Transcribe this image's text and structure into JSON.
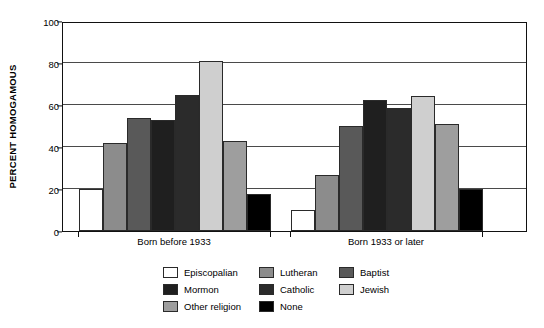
{
  "chart_data": {
    "type": "bar",
    "title": "",
    "subtitle": "",
    "xlabel": "",
    "ylabel": "PERCENT HOMOGAMOUS",
    "ylim": [
      0,
      100
    ],
    "yticks": [
      0,
      20,
      40,
      60,
      80,
      100
    ],
    "ytick_labels": [
      "0",
      "20",
      "40",
      "60",
      "80",
      "100"
    ],
    "grid": true,
    "legend_position": "bottom",
    "categories": [
      "Born before 1933",
      "Born 1933 or later"
    ],
    "series": [
      {
        "name": "Episcopalian",
        "color": "#ffffff",
        "values": [
          20,
          10
        ]
      },
      {
        "name": "Lutheran",
        "color": "#8c8c8c",
        "values": [
          42,
          26.5
        ]
      },
      {
        "name": "Baptist",
        "color": "#595959",
        "values": [
          54,
          50
        ]
      },
      {
        "name": "Mormon",
        "color": "#1f1f1f",
        "values": [
          53,
          62.5
        ]
      },
      {
        "name": "Catholic",
        "color": "#2b2b2b",
        "values": [
          65,
          58.5
        ]
      },
      {
        "name": "Jewish",
        "color": "#cfcfcf",
        "values": [
          81,
          64.5
        ]
      },
      {
        "name": "Other religion",
        "color": "#9e9e9e",
        "values": [
          43,
          51
        ]
      },
      {
        "name": "None",
        "color": "#000000",
        "values": [
          17.5,
          20
        ]
      }
    ]
  },
  "legend": {
    "rows": [
      [
        {
          "label": "Episcopalian",
          "color": "#ffffff"
        },
        {
          "label": "Lutheran",
          "color": "#8c8c8c"
        },
        {
          "label": "Baptist",
          "color": "#595959"
        }
      ],
      [
        {
          "label": "Mormon",
          "color": "#1f1f1f"
        },
        {
          "label": "Catholic",
          "color": "#2b2b2b"
        },
        {
          "label": "Jewish",
          "color": "#cfcfcf"
        }
      ],
      [
        {
          "label": "Other religion",
          "color": "#9e9e9e"
        },
        {
          "label": "None",
          "color": "#000000"
        }
      ]
    ]
  },
  "style": {
    "axis_color": "#111111",
    "gridline_color": "#4a4a4a",
    "bar_border_color": "#2a2a2a",
    "background": "#ffffff"
  }
}
